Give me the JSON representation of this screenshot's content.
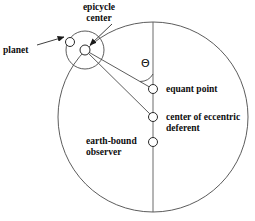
{
  "figure": {
    "background_color": "#ffffff",
    "stroke_color": "#3a3a3a",
    "text_color": "#0d0d0d",
    "width": 255,
    "height": 221
  },
  "labels": {
    "epicycle_center": "epicycle\ncenter",
    "planet": "planet",
    "equant_point": "equant point",
    "center_of_eccentric_deferent": "center of eccentric\ndeferent",
    "earth_bound_observer": "earth-bound\nobserver",
    "theta": "Θ"
  },
  "geometry": {
    "deferent_circle": {
      "name": "eccentric deferent",
      "cx": 153,
      "cy": 117,
      "r": 95
    },
    "epicycle_circle": {
      "name": "epicycle",
      "cx": 85,
      "cy": 50,
      "r": 19
    },
    "axis_line": {
      "name": "apsidal line",
      "x": 153,
      "y1": 22,
      "y2": 212
    },
    "nodes": [
      {
        "name": "epicycle-center-node",
        "cx": 85,
        "cy": 50,
        "r": 5
      },
      {
        "name": "planet-node",
        "cx": 70,
        "cy": 42,
        "r": 4.5
      },
      {
        "name": "equant-point-node",
        "cx": 153,
        "cy": 89,
        "r": 4.5
      },
      {
        "name": "center-of-eccentric-deferent-node",
        "cx": 153,
        "cy": 117,
        "r": 4.5
      },
      {
        "name": "earth-bound-observer-node",
        "cx": 153,
        "cy": 142,
        "r": 4.5
      }
    ],
    "radii_lines": [
      {
        "name": "epicycle-center-to-equant",
        "x1": 85,
        "y1": 50,
        "x2": 153,
        "y2": 89
      },
      {
        "name": "epicycle-center-to-deferent-center",
        "x1": 85,
        "y1": 50,
        "x2": 153,
        "y2": 117
      }
    ],
    "angle_arc": {
      "name": "theta-angle-arc",
      "vertex_x": 153,
      "vertex_y": 89,
      "radius": 15
    },
    "leader_lines": [
      {
        "name": "planet-leader",
        "x1": 38,
        "y1": 45,
        "x2": 66,
        "y2": 36,
        "arrow": true
      },
      {
        "name": "epicycle-center-leader",
        "x1": 107,
        "y1": 27,
        "x2": 89,
        "y2": 45,
        "arrow": true
      }
    ]
  }
}
